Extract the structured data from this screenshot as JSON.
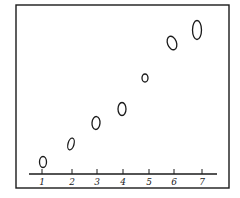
{
  "chart_data": {
    "type": "scatter",
    "title": "",
    "xlabel": "",
    "ylabel": "",
    "x_ticks": [
      "1",
      "2",
      "3",
      "4",
      "5",
      "6",
      "7"
    ],
    "x": [
      1,
      2,
      3,
      4,
      5,
      6,
      7
    ],
    "y": [
      1,
      2.2,
      3.6,
      4.5,
      6.6,
      8.8,
      9.7
    ],
    "y_axis_visible": false,
    "grid": false,
    "legend": null,
    "marker": "hollow-ellipse",
    "note": "y values are relative heights above the axis (no y-axis scale shown)"
  },
  "style": {
    "ink_color": "#1a1a1a",
    "background": "#ffffff"
  },
  "layout": {
    "frame": {
      "x": 16,
      "y": 5,
      "w": 213,
      "h": 183
    },
    "axis": {
      "x1": 29,
      "x2": 217,
      "y": 174
    },
    "ticks_px": [
      42,
      72,
      97,
      123,
      149,
      174,
      202
    ],
    "points_px": [
      {
        "cx": 43,
        "cy": 162,
        "rx": 3.5,
        "ry": 5.5,
        "rot": 0
      },
      {
        "cx": 71,
        "cy": 144,
        "rx": 3,
        "ry": 6,
        "rot": 15
      },
      {
        "cx": 96,
        "cy": 123,
        "rx": 4,
        "ry": 6.5,
        "rot": 5
      },
      {
        "cx": 122,
        "cy": 109,
        "rx": 4,
        "ry": 6.5,
        "rot": 0
      },
      {
        "cx": 145,
        "cy": 78,
        "rx": 3,
        "ry": 4,
        "rot": 0
      },
      {
        "cx": 172,
        "cy": 43,
        "rx": 4.5,
        "ry": 7,
        "rot": -20
      },
      {
        "cx": 197,
        "cy": 30,
        "rx": 4.5,
        "ry": 9.5,
        "rot": 0
      }
    ]
  }
}
